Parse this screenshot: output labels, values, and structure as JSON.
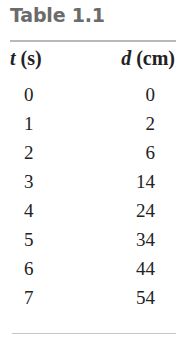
{
  "table": {
    "title": "Table 1.1",
    "columns": [
      {
        "symbol": "t",
        "unit": "(s)"
      },
      {
        "symbol": "d",
        "unit": "(cm)"
      }
    ],
    "rows": [
      {
        "t": "0",
        "d": "0"
      },
      {
        "t": "1",
        "d": "2"
      },
      {
        "t": "2",
        "d": "6"
      },
      {
        "t": "3",
        "d": "14"
      },
      {
        "t": "4",
        "d": "24"
      },
      {
        "t": "5",
        "d": "34"
      },
      {
        "t": "6",
        "d": "44"
      },
      {
        "t": "7",
        "d": "54"
      }
    ]
  }
}
